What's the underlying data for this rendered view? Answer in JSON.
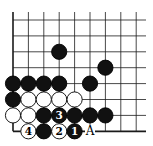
{
  "diagram": {
    "type": "go-problem",
    "board_section": "bottom-left corner",
    "grid": {
      "cols": 9,
      "rows": 8,
      "x0": 13,
      "dx": 15.4,
      "y0": 20,
      "dy": 15.9,
      "top_open": true,
      "right_open": true,
      "left_edge": true,
      "bottom_edge": true
    },
    "stones": [
      {
        "color": "black",
        "col": 3,
        "row": 2,
        "label": ""
      },
      {
        "color": "black",
        "col": 6,
        "row": 3,
        "label": ""
      },
      {
        "color": "black",
        "col": 0,
        "row": 4,
        "label": ""
      },
      {
        "color": "black",
        "col": 1,
        "row": 4,
        "label": ""
      },
      {
        "color": "black",
        "col": 2,
        "row": 4,
        "label": ""
      },
      {
        "color": "black",
        "col": 3,
        "row": 4,
        "label": ""
      },
      {
        "color": "black",
        "col": 5,
        "row": 4,
        "label": ""
      },
      {
        "color": "black",
        "col": 0,
        "row": 5,
        "label": ""
      },
      {
        "color": "white",
        "col": 1,
        "row": 5,
        "label": ""
      },
      {
        "color": "white",
        "col": 2,
        "row": 5,
        "label": ""
      },
      {
        "color": "white",
        "col": 3,
        "row": 5,
        "label": ""
      },
      {
        "color": "white",
        "col": 4,
        "row": 5,
        "label": ""
      },
      {
        "color": "white",
        "col": 0,
        "row": 6,
        "label": ""
      },
      {
        "color": "white",
        "col": 1,
        "row": 6,
        "label": ""
      },
      {
        "color": "black",
        "col": 2,
        "row": 6,
        "label": ""
      },
      {
        "color": "black",
        "col": 3,
        "row": 6,
        "label": "3"
      },
      {
        "color": "black",
        "col": 4,
        "row": 6,
        "label": ""
      },
      {
        "color": "black",
        "col": 5,
        "row": 6,
        "label": ""
      },
      {
        "color": "black",
        "col": 6,
        "row": 6,
        "label": ""
      },
      {
        "color": "white",
        "col": 1,
        "row": 7,
        "label": "4"
      },
      {
        "color": "black",
        "col": 2,
        "row": 7,
        "label": ""
      },
      {
        "color": "white",
        "col": 3,
        "row": 7,
        "label": "2"
      },
      {
        "color": "black",
        "col": 4,
        "row": 7,
        "label": "1"
      }
    ],
    "markers": [
      {
        "col": 5,
        "row": 7,
        "text": "A"
      }
    ],
    "colors": {
      "line": "#1a1a1a",
      "black": "#111111",
      "white": "#ffffff",
      "background": "#ffffff"
    }
  }
}
